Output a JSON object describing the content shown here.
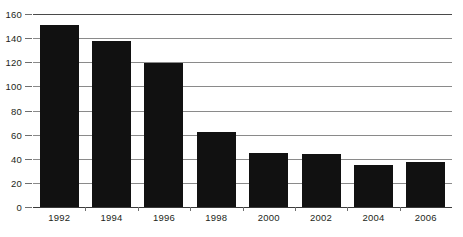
{
  "chart_data": {
    "type": "bar",
    "title": "",
    "subtitle": "",
    "xlabel": "",
    "ylabel": "",
    "categories": [
      "1992",
      "1994",
      "1996",
      "1998",
      "2000",
      "2002",
      "2004",
      "2006"
    ],
    "values": [
      151,
      138,
      119,
      62,
      45,
      44,
      35,
      37
    ],
    "series": [
      {
        "name": "",
        "values": [
          151,
          138,
          119,
          62,
          45,
          44,
          35,
          37
        ]
      }
    ],
    "ylim": [
      0,
      160
    ],
    "yticks": [
      0,
      20,
      40,
      60,
      80,
      100,
      120,
      140,
      160
    ],
    "ytick_labels": [
      "0",
      "20",
      "40",
      "60",
      "80",
      "100",
      "120",
      "140",
      "160"
    ],
    "xtick_labels": [
      "1992",
      "1994",
      "1996",
      "1998",
      "2000",
      "2002",
      "2004",
      "2006"
    ],
    "grid": true,
    "grid_axis": "y",
    "legend": false,
    "legend_position": "none",
    "annotations": [],
    "colors": {
      "bar": "#111111",
      "gridline": "#8a8a8a",
      "axis": "#3a3a3a",
      "top_rule": "#4a4a4a",
      "tick": "#6f6f6f",
      "text": "#231f20",
      "background": "#ffffff"
    }
  }
}
